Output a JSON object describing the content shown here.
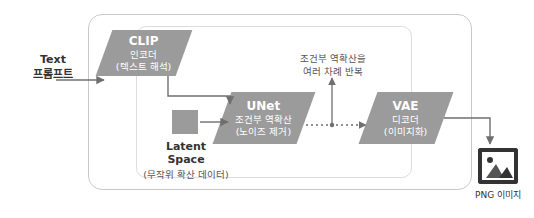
{
  "diagram": {
    "title_text_prompt_line1": "Text",
    "title_text_prompt_line2": "프롬프트",
    "blocks": {
      "clip": {
        "title": "CLIP",
        "sub_line1": "인코더",
        "sub_line2": "(텍스트 해석)"
      },
      "unet": {
        "title": "UNet",
        "sub_line1": "조건부 역확산",
        "sub_line2": "(노이즈 제거)"
      },
      "vae": {
        "title": "VAE",
        "sub_line1": "디코더",
        "sub_line2": "(이미지화)"
      },
      "latent": {
        "label_line1": "Latent",
        "label_line2": "Space",
        "sub": "(무작위 확산 데이터)"
      }
    },
    "loop_note_line1": "조건부 역확산을",
    "loop_note_line2": "여러 차례 반복",
    "output": {
      "label": "PNG 이미지",
      "icon": "image-icon"
    },
    "colors": {
      "block_fill": "#9b9b9b",
      "arrow": "#6f6f6f",
      "border": "#c9c9c9",
      "text_dark": "#333333"
    }
  }
}
